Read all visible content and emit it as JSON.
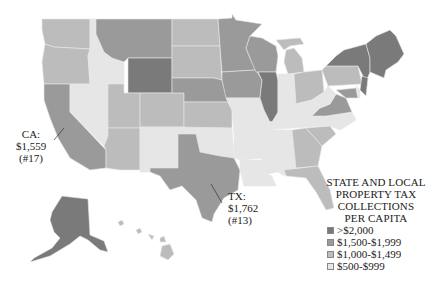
{
  "map": {
    "title_lines": [
      "STATE AND LOCAL",
      "PROPERTY TAX",
      "COLLECTIONS",
      "PER CAPITA"
    ],
    "legend": [
      {
        "label": ">$2,000",
        "color": "#7a7a7a"
      },
      {
        "label": "$1,500-$1,999",
        "color": "#9a9a9a"
      },
      {
        "label": "$1,000-$1,499",
        "color": "#bcbcbc"
      },
      {
        "label": "$500-$999",
        "color": "#e6e6e6"
      }
    ],
    "callouts": {
      "ca": {
        "state": "CA:",
        "value": "$1,559",
        "rank": "(#17)"
      },
      "tx": {
        "state": "TX:",
        "value": "$1,762",
        "rank": "(#13)"
      }
    }
  }
}
